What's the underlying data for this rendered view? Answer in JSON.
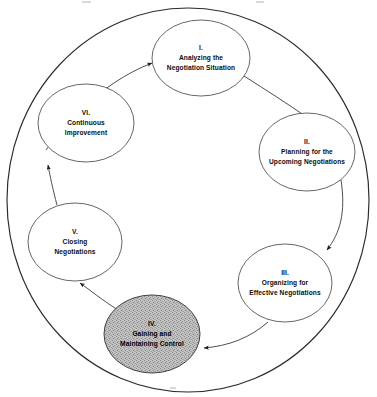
{
  "diagram": {
    "type": "circular-process-cycle",
    "outer_ring": {
      "name": "outer-circle",
      "cx": 188,
      "cy": 200,
      "rx": 181,
      "ry": 192,
      "stroke_color": "#2a2a2a"
    },
    "stage_count": 6,
    "flow_direction": "clockwise",
    "stages": [
      {
        "numeral": "I.",
        "line1": "Analyzing the",
        "line2": "Negotiation Situation",
        "cx": 201,
        "cy": 58,
        "rx": 49,
        "ry": 38,
        "shaded": false,
        "fill_color": "#ffffff"
      },
      {
        "numeral": "II.",
        "line1": "Planning for the",
        "line2": "Upcoming Negotiations",
        "cx": 307,
        "cy": 152,
        "rx": 48,
        "ry": 39,
        "shaded": false,
        "fill_color": "#ffffff"
      },
      {
        "numeral": "III.",
        "line1": "Organizing for",
        "line2": "Effective Negotiations",
        "cx": 285,
        "cy": 283,
        "rx": 47,
        "ry": 39,
        "shaded": false,
        "fill_color": "#ffffff"
      },
      {
        "numeral": "IV.",
        "line1": "Gaining and",
        "line2": "Maintaining Control",
        "cx": 152,
        "cy": 334,
        "rx": 48,
        "ry": 39,
        "shaded": true,
        "fill_color": "#b9b9b9"
      },
      {
        "numeral": "V.",
        "line1": "Closing",
        "line2": "Negotiations",
        "cx": 75,
        "cy": 242,
        "rx": 47,
        "ry": 39,
        "shaded": false,
        "fill_color": "#ffffff"
      },
      {
        "numeral": "VI.",
        "line1": "Continuous",
        "line2": "Improvement",
        "cx": 86,
        "cy": 123,
        "rx": 48,
        "ry": 39,
        "shaded": false,
        "fill_color": "#ffffff"
      }
    ],
    "connectors": [
      {
        "from": "VI.",
        "to": "I.",
        "name": "arrow-vi-to-i"
      },
      {
        "from": "I.",
        "to": "II.",
        "name": "arrow-i-to-ii"
      },
      {
        "from": "II.",
        "to": "III.",
        "name": "arrow-ii-to-iii"
      },
      {
        "from": "III.",
        "to": "IV.",
        "name": "arrow-iii-to-iv"
      },
      {
        "from": "IV.",
        "to": "V.",
        "name": "arrow-iv-to-v"
      },
      {
        "from": "V.",
        "to": "VI.",
        "name": "arrow-v-to-vi"
      }
    ]
  }
}
